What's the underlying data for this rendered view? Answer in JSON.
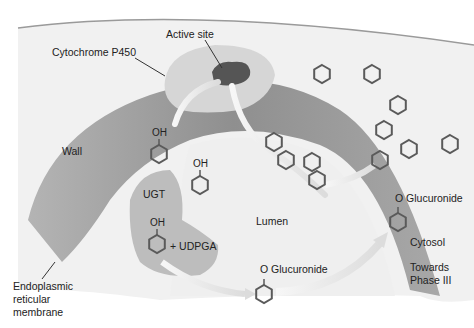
{
  "labels": {
    "cytochrome": "Cytochrome P450",
    "active_site": "Active site",
    "wall": "Wall",
    "ugt": "UGT",
    "lumen": "Lumen",
    "udpga": "+ UDPGA",
    "glucuronide_lumen": "O Glucuronide",
    "glucuronide_cytosol": "O Glucuronide",
    "cytosol": "Cytosol",
    "towards_line1": "Towards",
    "towards_line2": "Phase III",
    "er_line1": "Endoplasmic",
    "er_line2": "reticular",
    "er_line3": "membrane",
    "oh1": "OH",
    "oh2": "OH",
    "oh3": "OH"
  },
  "colors": {
    "background": "#f1f1f1",
    "membrane_dark": "#9a9a9a",
    "membrane_light": "#c8c8c8",
    "enzyme": "#d6d6d6",
    "active_site": "#555555",
    "hexagon": "#5a5a5a",
    "arrow": "#e8e8e8"
  }
}
